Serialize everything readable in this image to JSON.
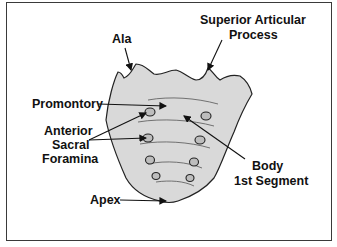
{
  "diagram": {
    "colors": {
      "bone_fill": "#d9d9d9",
      "outline": "#222222",
      "border": "#3a3a3a",
      "text": "#111111"
    },
    "labels": {
      "ala": "Ala",
      "superior_articular_1": "Superior Articular",
      "superior_articular_2": "Process",
      "promontory": "Promontory",
      "anterior_1": "Anterior",
      "anterior_2": "Sacral",
      "anterior_3": "Foramina",
      "body_1": "Body",
      "body_2": "1st Segment",
      "apex": "Apex"
    }
  }
}
